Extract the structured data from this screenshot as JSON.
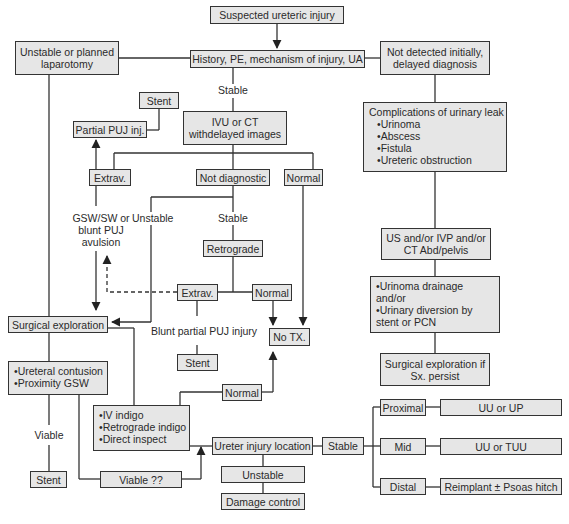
{
  "nodes": {
    "suspected": "Suspected ureteric injury",
    "history": "History, PE, mechanism of injury, UA",
    "unstable_lap": "Unstable or planned laparotomy",
    "not_detected": "Not detected initially, delayed diagnosis",
    "stable1": "Stable",
    "stent_top": "Stent",
    "partial_puj": "Partial PUJ inj.",
    "ivu_ct": "IVU or CT withdelayed images",
    "complications_title": "Complications of urinary leak",
    "complications_items": [
      "Urinoma",
      "Abscess",
      "Fistula",
      "Ureteric obstruction"
    ],
    "extrav1": "Extrav.",
    "not_diagnostic": "Not diagnostic",
    "normal1": "Normal",
    "gsw": "GSW/SW or blunt PUJ avulsion",
    "unstable_label": "Unstable",
    "stable2": "Stable",
    "retrograde": "Retrograde",
    "us_ivp": "US and/or IVP and/or CT Abd/pelvis",
    "extrav2": "Extrav.",
    "normal2": "Normal",
    "surgical_exploration": "Surgical exploration",
    "blunt_partial": "Blunt partial PUJ injury",
    "no_tx": "No TX.",
    "urinoma_items": [
      "Urinoma drainage and/or",
      "Urinary diversion by stent or PCN"
    ],
    "stent_mid": "Stent",
    "surgical_if": "Surgical exploration if Sx. persist",
    "contusion_items": [
      "Ureteral contusion",
      "Proximity GSW"
    ],
    "normal3": "Normal",
    "indigo_items": [
      "IV indigo",
      "Retrograde indigo",
      "Direct inspect"
    ],
    "viable": "Viable",
    "proximal": "Proximal",
    "uu_up": "UU or UP",
    "ureter_location": "Ureter injury location",
    "stable3": "Stable",
    "mid": "Mid",
    "uu_tuu": "UU or TUU",
    "stent_bottom": "Stent",
    "viable_q": "Viable ??",
    "unstable_box": "Unstable",
    "distal": "Distal",
    "reimplant": "Reimplant ± Psoas hitch",
    "damage_control": "Damage control"
  },
  "colors": {
    "box_fill": "#e6e6e6",
    "line": "#333333"
  }
}
